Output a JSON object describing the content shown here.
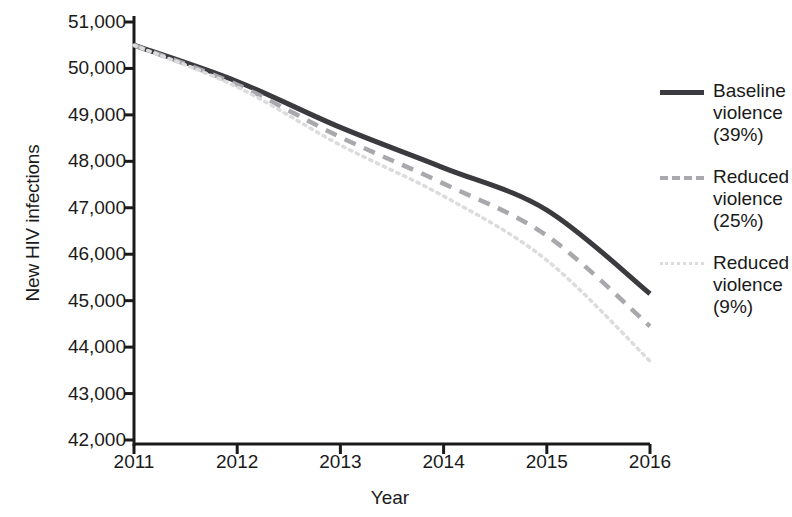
{
  "chart_data": {
    "type": "line",
    "title": "",
    "xlabel": "Year",
    "ylabel": "New HIV infections",
    "x": [
      2011,
      2012,
      2013,
      2014,
      2015,
      2016
    ],
    "xtick_labels": [
      "2011",
      "2012",
      "2013",
      "2014",
      "2015",
      "2016"
    ],
    "ytick_labels": [
      "51,000",
      "50,000",
      "49,000",
      "48,000",
      "47,000",
      "46,000",
      "45,000",
      "44,000",
      "43,000",
      "42,000"
    ],
    "ytick_values": [
      51000,
      50000,
      49000,
      48000,
      47000,
      46000,
      45000,
      44000,
      43000,
      42000
    ],
    "xlim": [
      2011,
      2016
    ],
    "ylim": [
      42000,
      51000
    ],
    "grid": false,
    "legend_position": "right",
    "series": [
      {
        "name": "Baseline violence (39%)",
        "label_lines": "Baseline\nviolence\n(39%)",
        "style": "solid",
        "color": "#3b3b3f",
        "values": [
          50500,
          49720,
          48730,
          47860,
          46950,
          45150
        ]
      },
      {
        "name": "Reduced violence (25%)",
        "label_lines": "Reduced\nviolence\n(25%)",
        "style": "dashed",
        "color": "#a9a9ad",
        "values": [
          50500,
          49650,
          48520,
          47520,
          46400,
          44450
        ]
      },
      {
        "name": "Reduced violence (9%)",
        "label_lines": "Reduced\nviolence\n(9%)",
        "style": "dotted",
        "color": "#dcdcde",
        "values": [
          50500,
          49600,
          48350,
          47250,
          45870,
          43700
        ]
      }
    ]
  },
  "legend": {
    "items": [
      {
        "label": "Baseline\nviolence\n(39%)",
        "swatch": "solid-line-swatch"
      },
      {
        "label": "Reduced\nviolence\n(25%)",
        "swatch": "dashed-line-swatch"
      },
      {
        "label": "Reduced\nviolence\n(9%)",
        "swatch": "dotted-line-swatch"
      }
    ]
  },
  "axes": {
    "y_title": "New HIV infections",
    "x_title": "Year"
  }
}
